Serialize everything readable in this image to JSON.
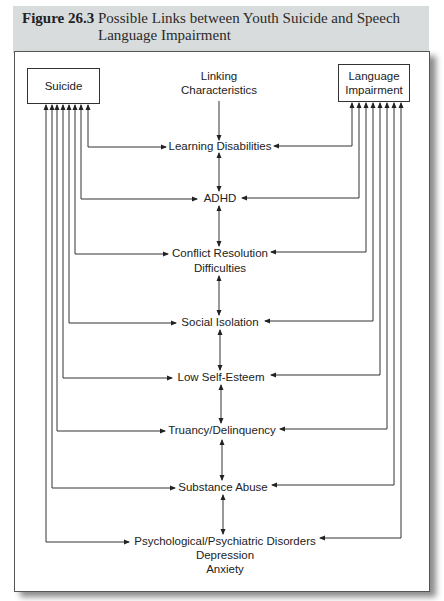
{
  "figure": {
    "number": "Figure 26.3",
    "title": "Possible Links between Youth Suicide and Speech Language Impairment"
  },
  "nodes": {
    "left": "Suicide",
    "right_line1": "Language",
    "right_line2": "Impairment",
    "center_header_line1": "Linking",
    "center_header_line2": "Characteristics"
  },
  "characteristics": [
    {
      "label": "Learning Disabilities"
    },
    {
      "label": "ADHD"
    },
    {
      "label": "Conflict Resolution",
      "label2": "Difficulties"
    },
    {
      "label": "Social Isolation"
    },
    {
      "label": "Low Self-Esteem"
    },
    {
      "label": "Truancy/Delinquency"
    },
    {
      "label": "Substance Abuse"
    },
    {
      "label": "Psychological/Psychiatric Disorders",
      "label2": "Depression",
      "label3": "Anxiety"
    }
  ],
  "colors": {
    "header_band": "#d9dcdc",
    "line": "#333333"
  }
}
